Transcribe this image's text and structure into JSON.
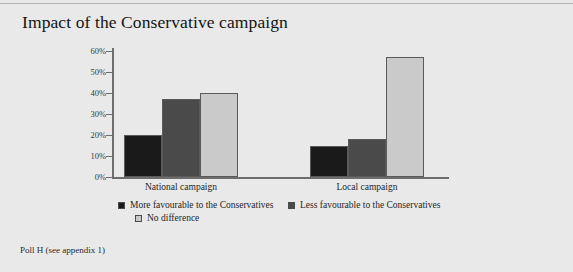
{
  "figure": {
    "title": "Impact of the Conservative campaign",
    "footnote": "Poll H (see appendix 1)",
    "background_color": "#e9e9e9"
  },
  "chart_data": {
    "type": "bar",
    "title": "Impact of the Conservative campaign",
    "xlabel": "",
    "ylabel": "",
    "categories": [
      "National campaign",
      "Local campaign"
    ],
    "series": [
      {
        "name": "More favourable to the Conservatives",
        "color": "#1a1a1a",
        "values": [
          20,
          15
        ]
      },
      {
        "name": "Less favourable to the Conservatives",
        "color": "#4a4a4a",
        "values": [
          37,
          18
        ]
      },
      {
        "name": "No difference",
        "color": "#cacaca",
        "values": [
          40,
          57
        ]
      }
    ],
    "ylim": [
      0,
      60
    ],
    "ytick_values": [
      0,
      10,
      20,
      30,
      40,
      50,
      60
    ],
    "ytick_labels": [
      "0%",
      "10%",
      "20%",
      "30%",
      "40%",
      "50%",
      "60%"
    ],
    "grid": false,
    "legend_position": "bottom"
  }
}
